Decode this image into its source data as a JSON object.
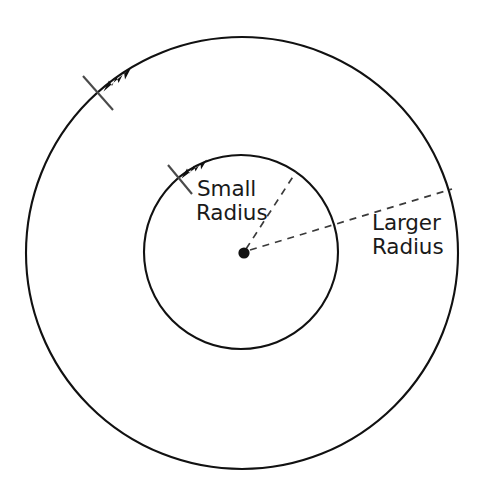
{
  "figure": {
    "background_color": "#ffffff",
    "stroke_color": "#111111",
    "dash_color": "#3a3a3a",
    "text_color": "#1a1a1a"
  },
  "labels": {
    "small_radius_line1": "Small",
    "small_radius_line2": "Radius",
    "larger_radius_line1": "Larger",
    "larger_radius_line2": "Radius"
  },
  "geometry": {
    "center": {
      "x": 243,
      "y": 253
    },
    "outer_circle": {
      "cx": 242,
      "cy": 253,
      "r": 216,
      "stroke_width": 2.1
    },
    "inner_circle": {
      "cx": 241,
      "cy": 252,
      "r": 97,
      "stroke_width": 2.1
    },
    "center_dot": {
      "cx": 244,
      "cy": 253,
      "r": 5.6
    },
    "small_radius_leader": {
      "x1": 246,
      "y1": 249,
      "x2": 296,
      "y2": 172
    },
    "larger_radius_leader": {
      "x1": 250,
      "y1": 250,
      "x2": 452,
      "y2": 189
    },
    "outer_arrow": {
      "tip_x": 104,
      "tip_y": 91,
      "angle_deg": 221
    },
    "inner_arrow": {
      "tip_x": 182,
      "tip_y": 177,
      "angle_deg": 228
    },
    "outer_tick": {
      "x1": 83,
      "y1": 76,
      "x2": 113,
      "y2": 110
    },
    "inner_tick": {
      "x1": 168,
      "y1": 165,
      "x2": 192,
      "y2": 194
    }
  },
  "text_positions": {
    "small_line1": {
      "x": 197,
      "y": 196
    },
    "small_line2": {
      "x": 196,
      "y": 220
    },
    "larger_line1": {
      "x": 372,
      "y": 230
    },
    "larger_line2": {
      "x": 372,
      "y": 254
    }
  }
}
